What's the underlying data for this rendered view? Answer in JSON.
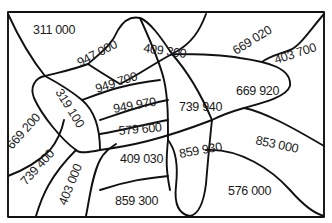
{
  "puzzle": {
    "shape": "fish",
    "regions": [
      {
        "id": "r1",
        "value": "311 000",
        "x": 33,
        "y": 34,
        "rotate": 0
      },
      {
        "id": "r2",
        "value": "947 000",
        "x": 80,
        "y": 67,
        "rotate": -28
      },
      {
        "id": "r3",
        "value": "409 300",
        "x": 143,
        "y": 52,
        "rotate": 8
      },
      {
        "id": "r4",
        "value": "669 020",
        "x": 236,
        "y": 55,
        "rotate": -32
      },
      {
        "id": "r5",
        "value": "403 700",
        "x": 276,
        "y": 64,
        "rotate": -18
      },
      {
        "id": "r6",
        "value": "949 700",
        "x": 97,
        "y": 93,
        "rotate": -18
      },
      {
        "id": "r7",
        "value": "319 100",
        "x": 55,
        "y": 92,
        "rotate": 58
      },
      {
        "id": "r8",
        "value": "949 970",
        "x": 114,
        "y": 113,
        "rotate": -10
      },
      {
        "id": "r9",
        "value": "739 940",
        "x": 179,
        "y": 111,
        "rotate": 0
      },
      {
        "id": "r10",
        "value": "669 920",
        "x": 236,
        "y": 95,
        "rotate": 0
      },
      {
        "id": "r11",
        "value": "579 600",
        "x": 119,
        "y": 135,
        "rotate": -5
      },
      {
        "id": "r12",
        "value": "669 200",
        "x": 12,
        "y": 150,
        "rotate": -48
      },
      {
        "id": "r13",
        "value": "409 030",
        "x": 120,
        "y": 163,
        "rotate": 0
      },
      {
        "id": "r14",
        "value": "859 930",
        "x": 180,
        "y": 158,
        "rotate": -10
      },
      {
        "id": "r15",
        "value": "853 000",
        "x": 255,
        "y": 144,
        "rotate": 12
      },
      {
        "id": "r16",
        "value": "739 400",
        "x": 26,
        "y": 186,
        "rotate": -48
      },
      {
        "id": "r17",
        "value": "403 000",
        "x": 66,
        "y": 206,
        "rotate": -68
      },
      {
        "id": "r18",
        "value": "859 300",
        "x": 115,
        "y": 205,
        "rotate": 0
      },
      {
        "id": "r19",
        "value": "576 000",
        "x": 228,
        "y": 195,
        "rotate": 0
      }
    ]
  }
}
